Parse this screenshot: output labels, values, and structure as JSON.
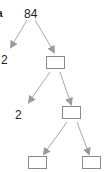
{
  "diagram": {
    "type": "factor-tree",
    "partial_label": "a",
    "root": {
      "value": "84"
    },
    "level1": {
      "left": {
        "value": "2"
      },
      "right": {
        "value": ""
      }
    },
    "level2": {
      "left": {
        "value": "2"
      },
      "right": {
        "value": ""
      }
    },
    "level3": {
      "left": {
        "value": ""
      },
      "right": {
        "value": ""
      }
    },
    "colors": {
      "arrow": "#9a9a9a",
      "box_border": "#8a8a8a",
      "text": "#222222"
    }
  }
}
